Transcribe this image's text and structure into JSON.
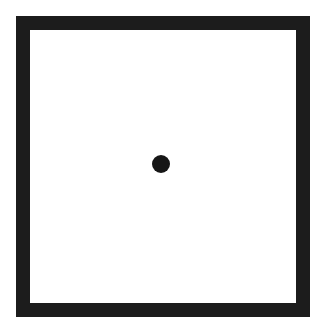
{
  "figure": {
    "shapes": [
      {
        "type": "square-frame",
        "color": "#1c1c1c",
        "border_px": 14
      },
      {
        "type": "dot",
        "color": "#161616",
        "diameter_px": 18,
        "position": "center"
      }
    ]
  }
}
